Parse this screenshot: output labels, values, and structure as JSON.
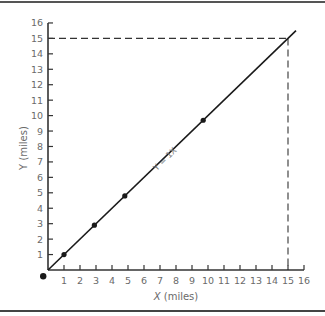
{
  "chart_data": {
    "type": "line",
    "title": "",
    "xlabel": "X (miles)",
    "ylabel": "Y (miles)",
    "xlim": [
      0,
      16
    ],
    "ylim": [
      0,
      16
    ],
    "x_ticks": [
      1,
      2,
      3,
      4,
      5,
      6,
      7,
      8,
      9,
      10,
      11,
      12,
      13,
      14,
      15,
      16
    ],
    "y_ticks": [
      1,
      2,
      3,
      4,
      5,
      6,
      7,
      8,
      9,
      10,
      11,
      12,
      13,
      14,
      15,
      16
    ],
    "grid": false,
    "series": [
      {
        "name": "Y = 1X",
        "line": {
          "x": [
            0,
            15.5
          ],
          "y": [
            0,
            15.5
          ]
        },
        "points": {
          "x": [
            1,
            2.9,
            4.8,
            9.7
          ],
          "y": [
            1,
            2.9,
            4.8,
            9.7
          ]
        }
      }
    ],
    "origin_marker": {
      "x": -0.3,
      "y": -0.4
    },
    "reference_lines": [
      {
        "type": "horizontal-dashed",
        "y": 15,
        "x_range": [
          0,
          15
        ]
      },
      {
        "type": "vertical-dashed",
        "x": 15,
        "y_range": [
          0,
          15
        ]
      }
    ],
    "annotations": [
      {
        "text": "Y = 1X",
        "x": 7.2,
        "y": 7.6,
        "rotation": -45
      }
    ]
  },
  "labels": {
    "xaxis_title_var": "X",
    "xaxis_title_unit": " (miles)",
    "yaxis_title": "Y (miles)",
    "line_label": "Y  =  1X"
  },
  "colors": {
    "line": "#1a1a1a",
    "axis": "#333333",
    "dashed": "#333333",
    "frame": "#444444",
    "text": "#6a6a6a"
  }
}
